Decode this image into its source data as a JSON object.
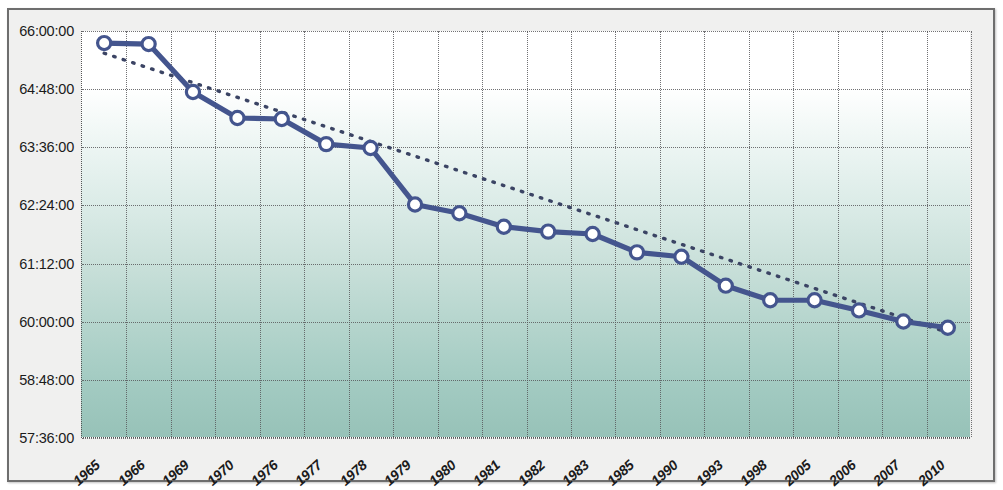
{
  "chart_data": {
    "type": "line",
    "title": "",
    "xlabel": "",
    "ylabel": "",
    "categories": [
      "1965",
      "1966",
      "1969",
      "1970",
      "1976",
      "1977",
      "1978",
      "1979",
      "1980",
      "1981",
      "1982",
      "1983",
      "1985",
      "1990",
      "1993",
      "1998",
      "2005",
      "2006",
      "2007",
      "2010"
    ],
    "y_tick_labels": [
      "66:00:00",
      "64:48:00",
      "63:36:00",
      "62:24:00",
      "61:12:00",
      "60:00:00",
      "58:48:00",
      "57:36:00"
    ],
    "y_tick_values": [
      66.0,
      64.8,
      63.6,
      62.4,
      61.2,
      60.0,
      58.8,
      57.6
    ],
    "ylim": [
      57.6,
      66.0
    ],
    "grid": true,
    "legend": "none",
    "series": [
      {
        "name": "measured-series",
        "style": "solid-line-with-circle-markers",
        "color": "#44558e",
        "values": [
          65.75,
          65.73,
          64.74,
          64.2,
          64.18,
          63.66,
          63.58,
          62.41,
          62.23,
          61.95,
          61.85,
          61.8,
          61.42,
          61.33,
          60.73,
          60.43,
          60.43,
          60.22,
          59.99,
          59.86
        ],
        "value_labels": [
          "65:45:00",
          "65:44:00",
          "64:44:00",
          "64:12:00",
          "64:11:00",
          "63:40:00",
          "63:35:00",
          "62:25:00",
          "62:14:00",
          "61:57:00",
          "61:51:00",
          "61:48:00",
          "61:25:00",
          "61:20:00",
          "60:44:00",
          "60:26:00",
          "60:26:00",
          "60:13:00",
          "59:59:00",
          "59:52:00"
        ]
      },
      {
        "name": "linear-trend-line",
        "style": "dotted-trendline",
        "color": "#3b4464",
        "endpoints": [
          {
            "category": "1965",
            "value": 65.54
          },
          {
            "category": "2010",
            "value": 59.76
          }
        ]
      }
    ]
  },
  "axes": {
    "y": {
      "ticks": [
        {
          "label": "66:00:00",
          "value": 66.0
        },
        {
          "label": "64:48:00",
          "value": 64.8
        },
        {
          "label": "63:36:00",
          "value": 63.6
        },
        {
          "label": "62:24:00",
          "value": 62.4
        },
        {
          "label": "61:12:00",
          "value": 61.2
        },
        {
          "label": "60:00:00",
          "value": 60.0
        },
        {
          "label": "58:48:00",
          "value": 58.8
        },
        {
          "label": "57:36:00",
          "value": 57.6
        }
      ]
    },
    "x": {
      "ticks": [
        {
          "label": "1965"
        },
        {
          "label": "1966"
        },
        {
          "label": "1969"
        },
        {
          "label": "1970"
        },
        {
          "label": "1976"
        },
        {
          "label": "1977"
        },
        {
          "label": "1978"
        },
        {
          "label": "1979"
        },
        {
          "label": "1980"
        },
        {
          "label": "1981"
        },
        {
          "label": "1982"
        },
        {
          "label": "1983"
        },
        {
          "label": "1985"
        },
        {
          "label": "1990"
        },
        {
          "label": "1993"
        },
        {
          "label": "1998"
        },
        {
          "label": "2005"
        },
        {
          "label": "2006"
        },
        {
          "label": "2007"
        },
        {
          "label": "2010"
        }
      ]
    }
  },
  "colors": {
    "series_line": "#44558e",
    "marker_fill": "#ffffff",
    "trendline": "#3b4464",
    "plot_gradient_top": "#ffffff",
    "plot_gradient_bottom": "#97c2b8",
    "frame_background": "#f0f0ef",
    "frame_border": "#6e6e6e",
    "gridline": "#59595c"
  }
}
